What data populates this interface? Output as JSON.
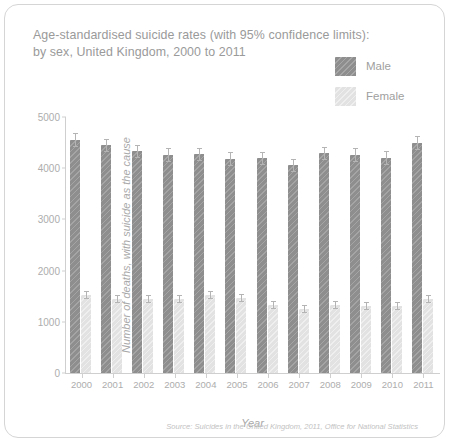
{
  "card": {
    "title_line1": "Age-standardised suicide rates (with 95% confidence limits):",
    "title_line2": "by sex, United Kingdom, 2000 to 2011",
    "source": "Source: Suicides in the United Kingdom, 2011, Office for National Statistics"
  },
  "legend": {
    "items": [
      {
        "label": "Male",
        "color": "#8e8e8e",
        "icon": "legend-swatch-male"
      },
      {
        "label": "Female",
        "color": "#e2e2e2",
        "icon": "legend-swatch-female"
      }
    ]
  },
  "chart_data": {
    "type": "bar",
    "title": "Age-standardised suicide rates (with 95% confidence limits): by sex, United Kingdom, 2000 to 2011",
    "xlabel": "Year",
    "ylabel": "Number of deaths, with suicide as the cause",
    "categories": [
      "2000",
      "2001",
      "2002",
      "2003",
      "2004",
      "2005",
      "2006",
      "2007",
      "2008",
      "2009",
      "2010",
      "2011"
    ],
    "ylim": [
      0,
      5000
    ],
    "yticks": [
      0,
      1000,
      2000,
      3000,
      4000,
      5000
    ],
    "ytick_labels": [
      "0",
      "1000",
      "2000",
      "3000",
      "4000",
      "5000"
    ],
    "grid": false,
    "legend_position": "top-right",
    "series": [
      {
        "name": "Male",
        "color": "#8e8e8e",
        "values": [
          4550,
          4450,
          4330,
          4260,
          4270,
          4180,
          4190,
          4060,
          4290,
          4260,
          4200,
          4490
        ],
        "ci_low": [
          4420,
          4320,
          4200,
          4130,
          4140,
          4050,
          4060,
          3930,
          4160,
          4130,
          4070,
          4360
        ],
        "ci_high": [
          4680,
          4580,
          4460,
          4390,
          4400,
          4310,
          4320,
          4190,
          4420,
          4390,
          4330,
          4620
        ]
      },
      {
        "name": "Female",
        "color": "#e2e2e2",
        "values": [
          1520,
          1440,
          1450,
          1440,
          1520,
          1460,
          1320,
          1250,
          1330,
          1310,
          1300,
          1440
        ],
        "ci_low": [
          1440,
          1360,
          1370,
          1360,
          1440,
          1380,
          1250,
          1180,
          1260,
          1240,
          1230,
          1360
        ],
        "ci_high": [
          1600,
          1520,
          1530,
          1520,
          1600,
          1540,
          1400,
          1320,
          1410,
          1390,
          1380,
          1520
        ]
      }
    ]
  }
}
